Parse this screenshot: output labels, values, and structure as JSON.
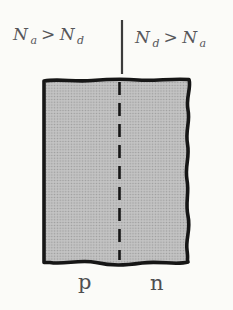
{
  "figure": {
    "top_labels": {
      "left": {
        "var1_base": "N",
        "var1_sub": "a",
        "operator": ">",
        "var2_base": "N",
        "var2_sub": "d"
      },
      "right": {
        "var1_base": "N",
        "var1_sub": "d",
        "operator": ">",
        "var2_base": "N",
        "var2_sub": "a"
      }
    },
    "region_labels": {
      "left": "p",
      "right": "n"
    },
    "colors": {
      "background": "#fbfbf8",
      "block_fill": "#c3c3c3",
      "block_dot": "#9a9a9a",
      "outline": "#161616",
      "separator": "#3c3c3c",
      "formula_text": "#56565a",
      "region_text": "#4e4e50"
    }
  }
}
